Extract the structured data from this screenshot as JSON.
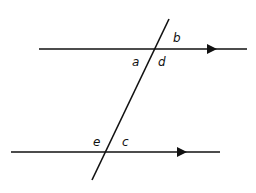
{
  "diagram": {
    "type": "parallel-lines-transversal",
    "stroke_color": "#111111",
    "background": "#ffffff",
    "lines": {
      "top": {
        "x1": 39,
        "y1": 49,
        "x2": 247,
        "y2": 49,
        "arrow_x": 216
      },
      "bottom": {
        "x1": 11,
        "y1": 152,
        "x2": 220,
        "y2": 152,
        "arrow_x": 186
      },
      "transversal": {
        "x1": 169,
        "y1": 19,
        "x2": 92,
        "y2": 180
      }
    },
    "labels": {
      "b": "b",
      "a": "a",
      "d": "d",
      "e": "e",
      "c": "c"
    }
  }
}
